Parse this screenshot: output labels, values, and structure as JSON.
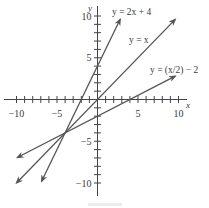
{
  "chart_data": {
    "type": "line",
    "title": "",
    "xlabel": "x",
    "ylabel": "y",
    "xlim": [
      -11,
      11
    ],
    "ylim": [
      -11,
      11
    ],
    "grid": false,
    "x_ticks": [
      -10,
      -9,
      -8,
      -7,
      -6,
      -5,
      -4,
      -3,
      -2,
      -1,
      1,
      2,
      3,
      4,
      5,
      6,
      7,
      8,
      9,
      10
    ],
    "y_ticks": [
      -10,
      -9,
      -8,
      -7,
      -6,
      -5,
      -4,
      -3,
      -2,
      -1,
      1,
      2,
      3,
      4,
      5,
      6,
      7,
      8,
      9,
      10
    ],
    "x_tick_labels": [
      {
        "value": -10,
        "text": "−10"
      },
      {
        "value": -5,
        "text": "−5"
      },
      {
        "value": 5,
        "text": "5"
      },
      {
        "value": 10,
        "text": "10"
      }
    ],
    "y_tick_labels": [
      {
        "value": 10,
        "text": "10"
      },
      {
        "value": 5,
        "text": "5"
      },
      {
        "value": -5,
        "text": "−5"
      },
      {
        "value": -10,
        "text": "−10"
      }
    ],
    "series": [
      {
        "name": "y = 2x + 4",
        "equation": "2x+4",
        "x": [
          -6.9,
          2.8
        ],
        "y": [
          -9.8,
          9.6
        ],
        "label_pos": [
          112,
          15
        ]
      },
      {
        "name": "y = x",
        "equation": "x",
        "x": [
          -10,
          9.6
        ],
        "y": [
          -10,
          9.6
        ],
        "label_pos": [
          129,
          43
        ]
      },
      {
        "name": "y = (x/2) − 2",
        "equation": "x/2-2",
        "x": [
          -9.9,
          9.6
        ],
        "y": [
          -6.95,
          2.8
        ],
        "label_pos": [
          150,
          73
        ]
      }
    ],
    "intersection": {
      "x": -4,
      "y": -4
    },
    "legend": "inline labels near line ends"
  },
  "axes": {
    "x_name": "x",
    "y_name": "y"
  }
}
